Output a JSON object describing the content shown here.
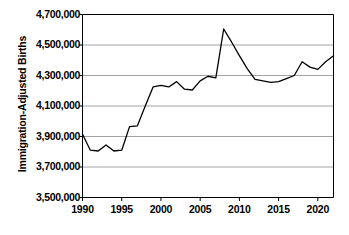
{
  "chart_data": {
    "type": "line",
    "title": "",
    "xlabel": "",
    "ylabel": "Immigration-Adjusted Births",
    "xlim": [
      1990,
      2022
    ],
    "ylim": [
      3500000,
      4700000
    ],
    "grid": true,
    "legend": "none",
    "y_ticks": [
      "3,500,000",
      "3,700,000",
      "3,900,000",
      "4,100,000",
      "4,300,000",
      "4,500,000",
      "4,700,000"
    ],
    "y_tick_values": [
      3500000,
      3700000,
      3900000,
      4100000,
      4300000,
      4500000,
      4700000
    ],
    "x_ticks": [
      "1990",
      "1995",
      "2000",
      "2005",
      "2010",
      "2015",
      "2020"
    ],
    "x_tick_values": [
      1990,
      1995,
      2000,
      2005,
      2010,
      2015,
      2020
    ],
    "series": [
      {
        "name": "Immigration-Adjusted Births",
        "color": "#000000",
        "x": [
          1990,
          1991,
          1992,
          1993,
          1994,
          1995,
          1996,
          1997,
          1998,
          1999,
          2000,
          2001,
          2002,
          2003,
          2004,
          2005,
          2006,
          2007,
          2008,
          2009,
          2010,
          2011,
          2012,
          2013,
          2014,
          2015,
          2016,
          2017,
          2018,
          2019,
          2020,
          2021,
          2022
        ],
        "values": [
          3915000,
          3810000,
          3805000,
          3845000,
          3805000,
          3810000,
          3965000,
          3970000,
          4100000,
          4225000,
          4235000,
          4225000,
          4260000,
          4210000,
          4205000,
          4265000,
          4295000,
          4285000,
          4605000,
          4520000,
          4430000,
          4345000,
          4275000,
          4265000,
          4255000,
          4260000,
          4280000,
          4300000,
          4390000,
          4355000,
          4340000,
          4390000,
          4430000
        ]
      }
    ]
  },
  "axis": {
    "y_label": "Immigration-Adjusted Births"
  }
}
